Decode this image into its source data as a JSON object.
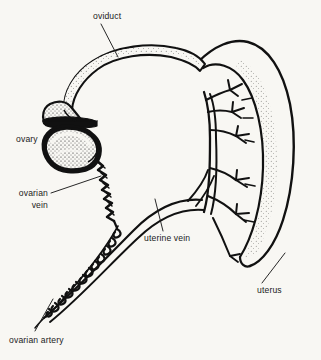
{
  "figure": {
    "kind": "anatomical-line-diagram",
    "background_color": "#f8f7f3",
    "ink_color": "#111111",
    "width": 321,
    "height": 360
  },
  "labels": {
    "oviduct": "oviduct",
    "ovary": "ovary",
    "ovarian_vein_l1": "ovarian",
    "ovarian_vein_l2": "vein",
    "uterine_vein": "uterine vein",
    "uterus": "uterus",
    "ovarian_artery": "ovarian artery"
  },
  "structures": [
    {
      "name": "oviduct",
      "description": "long slender curved tube with funnel-shaped infundibulum at left end"
    },
    {
      "name": "infundibulum",
      "description": "flattened funnel opening at the free end of the oviduct"
    },
    {
      "name": "ovary",
      "description": "bean-shaped stippled organ below the oviduct funnel"
    },
    {
      "name": "uterus",
      "description": "thick stippled curved horn on the right side"
    },
    {
      "name": "ovarian-vein",
      "description": "jagged zig-zag vessel running from the ovary downward"
    },
    {
      "name": "ovarian-artery",
      "description": "tightly coiled convoluted vessel running down to lower left"
    },
    {
      "name": "uterine-vein",
      "description": "smooth vessel arcing from lower left up to the uterine vessel tree"
    },
    {
      "name": "uterine-vessel-tree",
      "description": "branching vessels along the inner border of the uterus"
    }
  ]
}
